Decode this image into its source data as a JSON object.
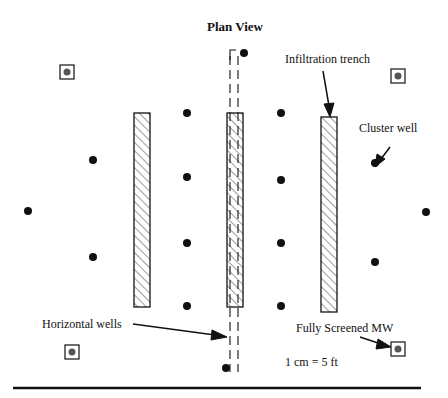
{
  "title": "Plan View",
  "labels": {
    "infiltration_trench": "Infiltration trench",
    "cluster_well": "Cluster well",
    "horizontal_wells": "Horizontal wells",
    "fully_screened_mw": "Fully Screened MW",
    "scale": "1 cm = 5 ft"
  },
  "legend_items": [
    {
      "symbol": "hatched-rectangle",
      "meaning": "Infiltration trench"
    },
    {
      "symbol": "filled-dot",
      "meaning": "Cluster well"
    },
    {
      "symbol": "dashed-double-line",
      "meaning": "Horizontal wells"
    },
    {
      "symbol": "boxed-dot",
      "meaning": "Fully Screened MW"
    }
  ],
  "colors": {
    "ink": "#111111",
    "mw_dot": "#555555",
    "background": "#ffffff"
  },
  "trenches": [
    {
      "x": 134,
      "y": 113,
      "w": 16,
      "h": 194
    },
    {
      "x": 227,
      "y": 113,
      "w": 16,
      "h": 194
    },
    {
      "x": 321,
      "y": 117,
      "w": 16,
      "h": 195
    }
  ],
  "cluster_wells": [
    {
      "x": 244,
      "y": 53
    },
    {
      "x": 187,
      "y": 113
    },
    {
      "x": 187,
      "y": 177
    },
    {
      "x": 187,
      "y": 243
    },
    {
      "x": 187,
      "y": 306
    },
    {
      "x": 281,
      "y": 113
    },
    {
      "x": 281,
      "y": 180
    },
    {
      "x": 281,
      "y": 243
    },
    {
      "x": 281,
      "y": 306
    },
    {
      "x": 93,
      "y": 160
    },
    {
      "x": 93,
      "y": 257
    },
    {
      "x": 28,
      "y": 211
    },
    {
      "x": 375,
      "y": 163
    },
    {
      "x": 375,
      "y": 262
    },
    {
      "x": 426,
      "y": 212
    },
    {
      "x": 226,
      "y": 368
    }
  ],
  "monitoring_wells": [
    {
      "x": 67,
      "y": 72
    },
    {
      "x": 398,
      "y": 76
    },
    {
      "x": 72,
      "y": 352
    },
    {
      "x": 398,
      "y": 349
    }
  ]
}
